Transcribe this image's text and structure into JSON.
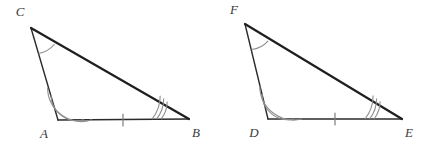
{
  "figure": {
    "background_color": "#ffffff",
    "side_stroke_color": "#2b2b2b",
    "hypotenuse_stroke_color": "#1f1f1f",
    "arc_stroke_color": "#8f8f8f",
    "tick_stroke_color": "#7d7d7d",
    "label_color": "#3a3a3a"
  },
  "triangles": [
    {
      "name": "triangle-abc",
      "vertices": [
        {
          "label": "C",
          "x": 31,
          "y": 28,
          "label_x": 20,
          "label_y": 16,
          "arcs": 1,
          "arc_name": "angle-arc-single"
        },
        {
          "label": "A",
          "x": 58,
          "y": 120,
          "label_x": 44,
          "label_y": 138,
          "arcs": 2,
          "arc_name": "angle-arc-double"
        },
        {
          "label": "B",
          "x": 189,
          "y": 119,
          "label_x": 196,
          "label_y": 137,
          "arcs": 3,
          "arc_name": "angle-arc-triple"
        }
      ],
      "base": {
        "from": "A",
        "to": "B",
        "ticks": 1,
        "tick_x": 123,
        "tick_y": 120
      }
    },
    {
      "name": "triangle-def",
      "vertices": [
        {
          "label": "F",
          "x": 245,
          "y": 24,
          "label_x": 234,
          "label_y": 14,
          "arcs": 1,
          "arc_name": "angle-arc-single"
        },
        {
          "label": "D",
          "x": 268,
          "y": 119,
          "label_x": 254,
          "label_y": 137,
          "arcs": 2,
          "arc_name": "angle-arc-double"
        },
        {
          "label": "E",
          "x": 402,
          "y": 119,
          "label_x": 409,
          "label_y": 137,
          "arcs": 3,
          "arc_name": "angle-arc-triple"
        }
      ],
      "base": {
        "from": "D",
        "to": "E",
        "ticks": 1,
        "tick_x": 335,
        "tick_y": 120
      }
    }
  ]
}
